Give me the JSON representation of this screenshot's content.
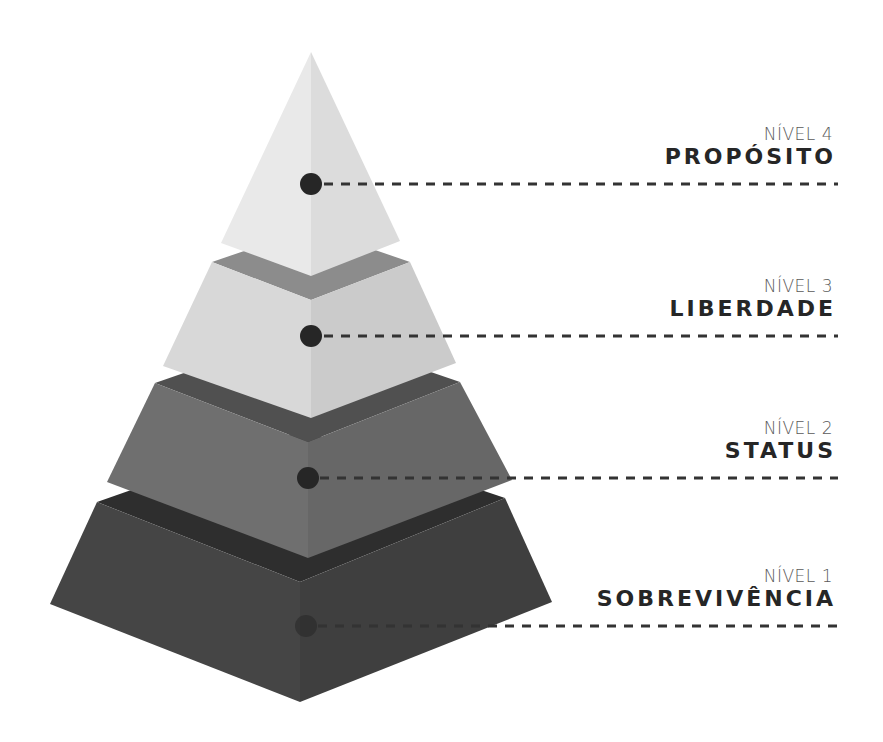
{
  "diagram": {
    "type": "pyramid",
    "colors": {
      "background": "#ffffff",
      "line": "#333333",
      "dot": "#262626"
    },
    "levels": [
      {
        "id": "level-4",
        "number_label": "NÍVEL 4",
        "name": "PROPÓSITO",
        "faces": {
          "left": "#e9e9e9",
          "right": "#dcdcdc"
        },
        "label_top": 124,
        "line_y": 184
      },
      {
        "id": "level-3",
        "number_label": "NÍVEL 3",
        "name": "LIBERDADE",
        "faces": {
          "top": "#8c8c8c",
          "left": "#d8d8d8",
          "right": "#cbcbcb"
        },
        "label_top": 276,
        "line_y": 336
      },
      {
        "id": "level-2",
        "number_label": "NÍVEL 2",
        "name": "STATUS",
        "faces": {
          "top": "#505050",
          "left": "#6f6f6f",
          "right": "#676767"
        },
        "label_top": 418,
        "line_y": 478
      },
      {
        "id": "level-1",
        "number_label": "NÍVEL 1",
        "name": "SOBREVIVÊNCIA",
        "faces": {
          "top": "#2e2e2e",
          "left": "#454545",
          "right": "#3f3f3f"
        },
        "label_top": 566,
        "line_y": 626
      }
    ]
  }
}
